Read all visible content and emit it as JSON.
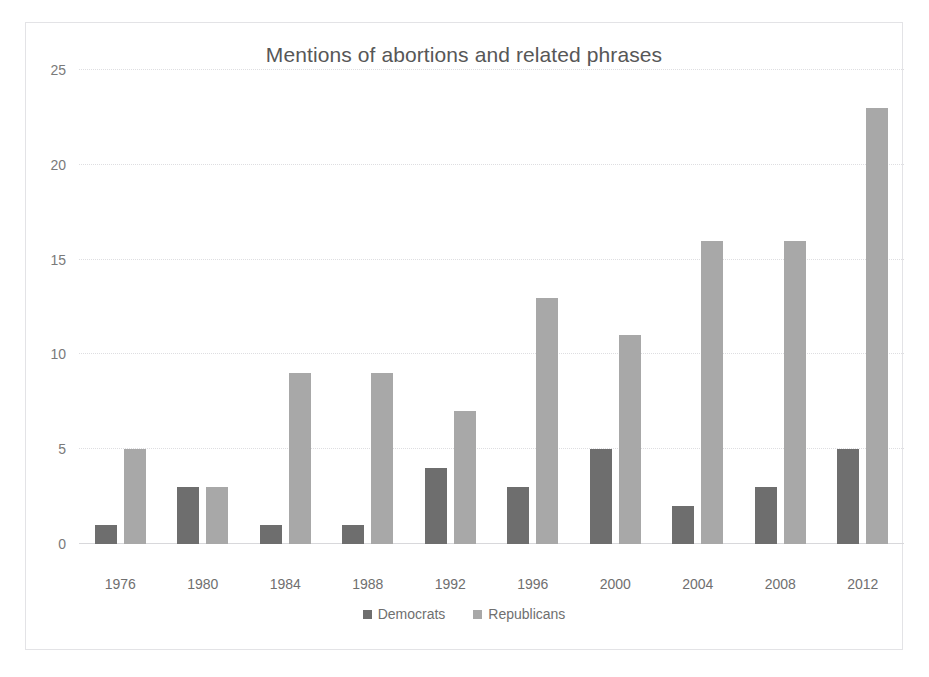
{
  "chart_data": {
    "type": "bar",
    "title": "Mentions of abortions and related phrases",
    "xlabel": "",
    "ylabel": "",
    "categories": [
      "1976",
      "1980",
      "1984",
      "1988",
      "1992",
      "1996",
      "2000",
      "2004",
      "2008",
      "2012"
    ],
    "series": [
      {
        "name": "Democrats",
        "color": "#6e6e6e",
        "values": [
          1,
          3,
          1,
          1,
          4,
          3,
          5,
          2,
          3,
          5
        ]
      },
      {
        "name": "Republicans",
        "color": "#a8a8a8",
        "values": [
          5,
          3,
          9,
          9,
          7,
          13,
          11,
          16,
          16,
          23
        ]
      }
    ],
    "ylim": [
      0,
      25
    ],
    "ytick_labels": [
      "0",
      "5",
      "10",
      "15",
      "20",
      "25"
    ],
    "ytick_values": [
      0,
      5,
      10,
      15,
      20,
      25
    ],
    "grid": true,
    "legend_position": "bottom"
  },
  "legend": {
    "items": [
      {
        "label": "Democrats",
        "color": "#6e6e6e"
      },
      {
        "label": "Republicans",
        "color": "#a8a8a8"
      }
    ]
  }
}
